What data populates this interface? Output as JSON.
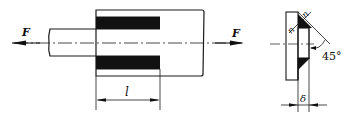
{
  "diagram": {
    "type": "engineering-drawing",
    "colors": {
      "line": "#1a1a1a",
      "weld_fill": "#111111",
      "background": "#ffffff"
    },
    "left_view": {
      "force_left_label": "F",
      "force_right_label": "F",
      "weld_length_label": "l"
    },
    "right_view": {
      "weld_leg_top_label": "n",
      "weld_leg_side_label": "n",
      "angle_label": "45°",
      "thickness_label": "δ"
    }
  }
}
